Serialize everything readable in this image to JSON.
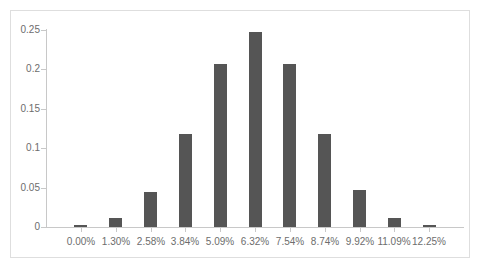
{
  "chart_data": {
    "type": "bar",
    "title": "",
    "subtitle": "",
    "xlabel": "",
    "ylabel": "",
    "categories": [
      "0.00%",
      "1.30%",
      "2.58%",
      "3.84%",
      "5.09%",
      "6.32%",
      "7.54%",
      "8.74%",
      "9.92%",
      "11.09%",
      "12.25%"
    ],
    "values": [
      0.002,
      0.011,
      0.045,
      0.118,
      0.207,
      0.248,
      0.207,
      0.118,
      0.047,
      0.011,
      0.002
    ],
    "ylim": [
      0,
      0.25
    ],
    "ytick_labels": [
      "0",
      "0.05",
      "0.1",
      "0.15",
      "0.2",
      "0.25"
    ],
    "ytick_values": [
      0,
      0.05,
      0.1,
      0.15,
      0.2,
      0.25
    ],
    "grid": false,
    "legend": null,
    "legend_position": "none",
    "annotations": []
  },
  "style": {
    "bar_color": "#555555",
    "axis_color": "#c8c8c8",
    "tick_label_color": "#6d6d6d",
    "frame_color": "#dedede",
    "background_color": "#ffffff"
  }
}
